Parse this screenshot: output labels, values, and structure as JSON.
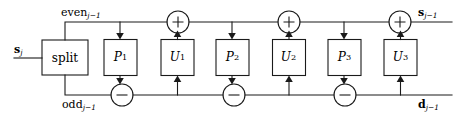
{
  "figure": {
    "kind": "lifting-scheme-signal-flow-diagram",
    "width": 459,
    "height": 122,
    "stroke_color": "#1a1a1a",
    "background_color": "#ffffff"
  },
  "labels": {
    "input_signal": "s",
    "input_signal_sub": "j",
    "even_branch": "even",
    "even_branch_sub": "j−1",
    "odd_branch": "odd",
    "odd_branch_sub": "j−1",
    "output_approx": "s",
    "output_approx_sub": "j−1",
    "output_detail": "d",
    "output_detail_sub": "j−1"
  },
  "blocks": {
    "split": {
      "label": "split"
    },
    "predict": [
      {
        "label": "P",
        "sub": "1"
      },
      {
        "label": "P",
        "sub": "2"
      },
      {
        "label": "P",
        "sub": "3"
      }
    ],
    "update": [
      {
        "label": "U",
        "sub": "1"
      },
      {
        "label": "U",
        "sub": "2"
      },
      {
        "label": "U",
        "sub": "3"
      }
    ]
  },
  "operators": {
    "adders": [
      "+",
      "+",
      "+"
    ],
    "subtractors": [
      "−",
      "−",
      "−"
    ]
  }
}
